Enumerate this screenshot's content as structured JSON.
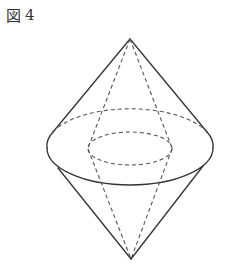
{
  "caption": {
    "label_glyph": "図",
    "number": "4"
  },
  "figure": {
    "type": "double-cone-with-inner-cone",
    "stroke_color": "#333333",
    "outer_solid": {
      "top_apex": [
        130,
        39
      ],
      "bottom_apex": [
        131,
        259
      ],
      "base_ellipse": {
        "cx": 130,
        "cy": 148,
        "rx": 83,
        "ry": 37
      }
    },
    "inner_hidden": {
      "ellipse": {
        "cx": 130,
        "cy": 148.5,
        "rx": 42,
        "ry": 16.5
      }
    }
  }
}
